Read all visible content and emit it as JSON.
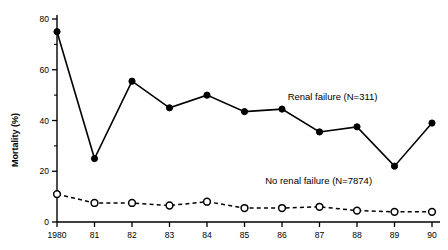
{
  "chart_data": {
    "type": "line",
    "title": "",
    "xlabel": "",
    "ylabel": "Mortality (%)",
    "x": [
      1980,
      1981,
      1982,
      1983,
      1984,
      1985,
      1986,
      1987,
      1988,
      1989,
      1990
    ],
    "xtick_labels": [
      "1980",
      "81",
      "82",
      "83",
      "84",
      "85",
      "86",
      "87",
      "88",
      "89",
      "90"
    ],
    "ytick_labels": [
      "0",
      "20",
      "40",
      "60",
      "80"
    ],
    "ytick_values": [
      0,
      20,
      40,
      60,
      80
    ],
    "yminor_values": [
      10,
      30,
      50,
      70
    ],
    "ylim": [
      0,
      80
    ],
    "grid": false,
    "legend_position": "inline-annotation",
    "series": [
      {
        "name": "Renal failure (N=311)",
        "marker": "filled-circle",
        "linestyle": "solid",
        "color": "#000000",
        "label_x": 1986.15,
        "label_y": 48,
        "values": [
          75,
          25,
          55.5,
          45,
          50,
          43.5,
          44.5,
          35.5,
          37.5,
          22,
          39
        ]
      },
      {
        "name": "No renal failure (N=7874)",
        "marker": "open-circle",
        "linestyle": "dashed",
        "color": "#000000",
        "label_x": 1985.55,
        "label_y": 15,
        "values": [
          11,
          7.5,
          7.5,
          6.5,
          8,
          5.5,
          5.5,
          6,
          4.5,
          4,
          4
        ]
      }
    ]
  },
  "axes": {
    "y_title": "Mortality (%)"
  },
  "colors": {
    "axis": "#000000",
    "series_primary": "#000000",
    "series_secondary": "#000000",
    "background": "#ffffff"
  }
}
